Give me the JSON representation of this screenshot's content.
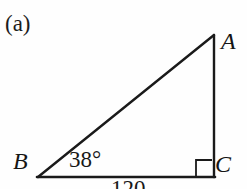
{
  "figure": {
    "part_label": "(a)",
    "top_clipped_text": "",
    "background_color": "#fefefe",
    "stroke_color": "#1a1a1a"
  },
  "diagram": {
    "type": "right-triangle",
    "vertices": [
      {
        "name": "A",
        "label": "A",
        "x": 214,
        "y": 35
      },
      {
        "name": "B",
        "label": "B",
        "x": 38,
        "y": 177
      },
      {
        "name": "C",
        "label": "C",
        "x": 214,
        "y": 177
      }
    ],
    "edges": [
      {
        "name": "hypotenuse-AB",
        "from": "A",
        "to": "B"
      },
      {
        "name": "leg-BC",
        "from": "B",
        "to": "C"
      },
      {
        "name": "leg-CA",
        "from": "C",
        "to": "A"
      }
    ],
    "angle_label": "38°",
    "angle_value": 38,
    "angle_at_vertex": "B",
    "right_angle_at_vertex": "C",
    "right_angle_marker": true,
    "side_label": "120",
    "side_label_edge": "BC"
  }
}
